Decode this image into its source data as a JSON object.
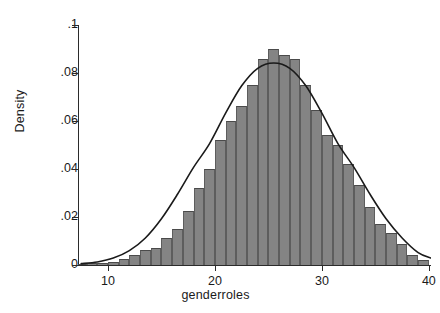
{
  "chart_data": {
    "type": "bar",
    "title": "",
    "subtitle": "",
    "xlabel": "genderroles",
    "ylabel": "Density",
    "xlim": [
      7.2,
      40.2
    ],
    "ylim": [
      0,
      0.1
    ],
    "grid": false,
    "legend": null,
    "xticks": [
      "10",
      "20",
      "30",
      "40"
    ],
    "xtick_values": [
      10,
      20,
      30,
      40
    ],
    "yticks": [
      "0",
      ".02",
      ".04",
      ".06",
      ".08",
      ".1"
    ],
    "ytick_values": [
      0,
      0.02,
      0.04,
      0.06,
      0.08,
      0.1
    ],
    "bin_width": 1,
    "bar_color": "#848484",
    "bar_edge_color": "#5d5d5d",
    "curve_color": "#1a1a1a",
    "categories": [
      7.5,
      8.5,
      9.5,
      10.5,
      11.5,
      12.5,
      13.5,
      14.5,
      15.5,
      16.5,
      17.5,
      18.5,
      19.5,
      20.5,
      21.5,
      22.5,
      23.5,
      24.5,
      25.5,
      26.5,
      27.5,
      28.5,
      29.5,
      30.5,
      31.5,
      32.5,
      33.5,
      34.5,
      35.5,
      36.5,
      37.5,
      38.5,
      39.5
    ],
    "values": [
      0.0004,
      0.0006,
      0.0008,
      0.0012,
      0.0022,
      0.0042,
      0.006,
      0.007,
      0.0112,
      0.015,
      0.0222,
      0.0318,
      0.04,
      0.052,
      0.06,
      0.066,
      0.075,
      0.0858,
      0.09,
      0.0872,
      0.0856,
      0.075,
      0.0644,
      0.054,
      0.0498,
      0.042,
      0.033,
      0.0242,
      0.017,
      0.0132,
      0.0088,
      0.004,
      0.002
    ],
    "overlay": {
      "type": "line",
      "name": "normal density",
      "mean": 25.5,
      "sd": 4.75,
      "peak": 0.084,
      "x": [
        7.5,
        9.0,
        10.5,
        12.0,
        13.5,
        15.0,
        16.5,
        18.0,
        19.5,
        21.0,
        22.5,
        24.0,
        25.5,
        27.0,
        28.5,
        30.0,
        31.5,
        33.0,
        34.5,
        36.0,
        37.5,
        39.0,
        40.2
      ],
      "y": [
        0.0004,
        0.0011,
        0.0027,
        0.0058,
        0.0111,
        0.0191,
        0.0293,
        0.0405,
        0.0504,
        0.0631,
        0.0745,
        0.0818,
        0.084,
        0.0818,
        0.0745,
        0.0631,
        0.0504,
        0.0405,
        0.0293,
        0.0191,
        0.0111,
        0.005,
        0.0027
      ]
    }
  }
}
